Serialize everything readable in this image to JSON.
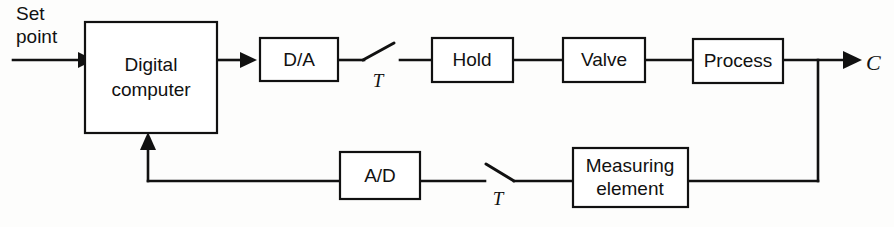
{
  "diagram": {
    "background_color": "#fdfdfc",
    "line_color": "#111111",
    "blocks": [
      {
        "id": "digital-computer",
        "label_line1": "Digital",
        "label_line2": "computer"
      },
      {
        "id": "da-converter",
        "label": "D/A"
      },
      {
        "id": "hold",
        "label": "Hold"
      },
      {
        "id": "valve",
        "label": "Valve"
      },
      {
        "id": "process",
        "label": "Process"
      },
      {
        "id": "measuring-element",
        "label_line1": "Measuring",
        "label_line2": "element"
      },
      {
        "id": "ad-converter",
        "label": "A/D"
      }
    ],
    "labels": {
      "setpoint_line1": "Set",
      "setpoint_line2": "point",
      "output": "C",
      "sampler_top": "T",
      "sampler_bottom": "T"
    }
  }
}
